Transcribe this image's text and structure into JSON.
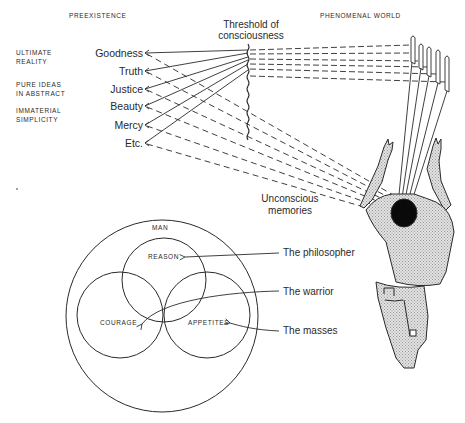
{
  "headers": {
    "left": "PREEXISTENCE",
    "right": "PHENOMENAL WORLD"
  },
  "realm_descriptors": [
    {
      "line1": "ULTIMATE",
      "line2": "REALITY"
    },
    {
      "line1": "PURE IDEAS",
      "line2": "IN ABSTRACT"
    },
    {
      "line1": "IMMATERIAL",
      "line2": "SIMPLICITY"
    }
  ],
  "ideas": [
    "Goodness",
    "Truth",
    "Justice",
    "Beauty",
    "Mercy",
    "Etc."
  ],
  "threshold": {
    "line1": "Threshold of",
    "line2": "consciousness"
  },
  "unconscious": {
    "line1": "Unconscious",
    "line2": "memories"
  },
  "soul_diagram": {
    "outer_label": "MAN",
    "parts": [
      {
        "label": "REASON",
        "class": "The philosopher"
      },
      {
        "label": "COURAGE",
        "class": "The warrior"
      },
      {
        "label": "APPETITES",
        "class": "The masses"
      }
    ]
  },
  "colors": {
    "ink": "#2a2a2a",
    "figure_fill": "#d6d6d6",
    "head": "#0a0a0a",
    "background": "#ffffff"
  }
}
